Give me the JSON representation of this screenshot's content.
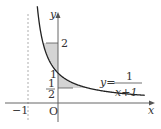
{
  "figure": {
    "type": "function-graph",
    "equation_label": {
      "lhs": "y=",
      "numerator": "1",
      "denominator": "x+1"
    },
    "axes": {
      "x_label": "x",
      "y_label": "y",
      "origin_label": "O"
    },
    "ticks": {
      "x_neg_one": "−1",
      "y_one": "1",
      "y_two": "2",
      "y_half_num": "1",
      "y_half_den": "2"
    },
    "asymptote_x": -1,
    "shaded_regions": [
      {
        "description": "region between curve and y-axis from y=1 to y=2"
      },
      {
        "description": "region between curve and y-axis from y=1/2 to y=1"
      }
    ],
    "colors": {
      "curve": "#222222",
      "shade": "#d4d4d4",
      "axis": "#555555",
      "asymptote": "#999999"
    }
  }
}
